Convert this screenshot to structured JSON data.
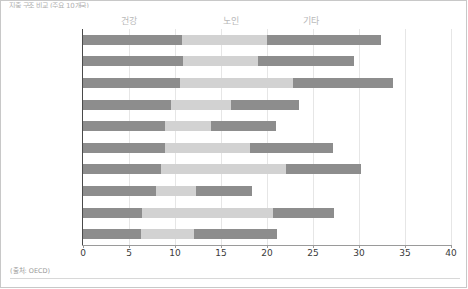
{
  "title": "지출 구조 비교 (주요 10개국)",
  "source": "(출처: OECD)",
  "legend": [
    {
      "label": "건강",
      "color": "#8d8d8d"
    },
    {
      "label": "노인",
      "color": "#d2d2d2"
    },
    {
      "label": "기타",
      "color": "#8d8d8d"
    }
  ],
  "axis": {
    "ticks": [
      "0",
      "5",
      "10",
      "15",
      "20",
      "25",
      "30",
      "35",
      "40"
    ]
  },
  "chart_data": {
    "type": "bar",
    "orientation": "horizontal",
    "stacked": true,
    "title": "지출 구조 비교 (주요 10개국)",
    "xlabel": "",
    "ylabel": "",
    "xlim": [
      0,
      40
    ],
    "grid": true,
    "legend_position": "top",
    "categories": [
      "벨기에",
      "노르웨이",
      "프랑스",
      "영국",
      "오스트레일리아",
      "스페인",
      "이탈리아",
      "캐나다",
      "그리스",
      "네덜란드"
    ],
    "series": [
      {
        "name": "건강",
        "color": "#8d8d8d",
        "values": [
          10.8,
          10.9,
          10.5,
          9.6,
          8.9,
          8.9,
          8.5,
          7.9,
          6.4,
          6.3
        ]
      },
      {
        "name": "노인",
        "color": "#d2d2d2",
        "values": [
          9.2,
          8.1,
          12.3,
          6.5,
          5.0,
          9.3,
          13.6,
          4.4,
          14.2,
          5.8
        ]
      },
      {
        "name": "기타",
        "color": "#8d8d8d",
        "values": [
          12.4,
          10.5,
          10.9,
          7.4,
          7.1,
          9.0,
          8.1,
          6.1,
          6.7,
          9.0
        ]
      }
    ],
    "totals": [
      32.4,
      29.5,
      33.7,
      23.5,
      21.0,
      27.2,
      30.2,
      18.4,
      27.3,
      21.1
    ]
  }
}
